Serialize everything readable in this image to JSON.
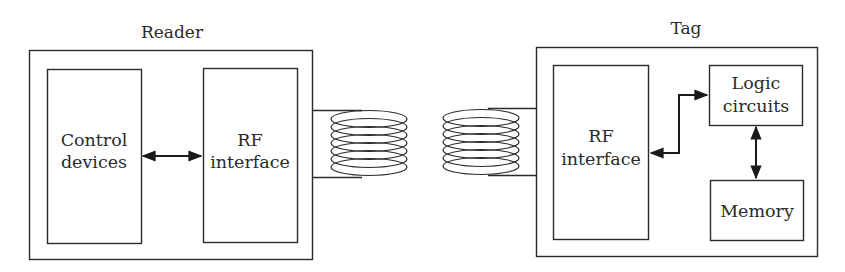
{
  "diagram": {
    "type": "block-diagram",
    "reader": {
      "title": "Reader",
      "blocks": {
        "control": [
          "Control",
          "devices"
        ],
        "rf": [
          "RF",
          "interface"
        ]
      }
    },
    "tag": {
      "title": "Tag",
      "blocks": {
        "rf": [
          "RF",
          "interface"
        ],
        "logic": [
          "Logic",
          "circuits"
        ],
        "memory": [
          "Memory"
        ]
      }
    },
    "connections": [
      {
        "from": "Control devices",
        "to": "RF interface (Reader)",
        "type": "bidirectional"
      },
      {
        "from": "RF interface (Reader)",
        "to": "Reader antenna coil",
        "type": "wire"
      },
      {
        "from": "Reader antenna coil",
        "to": "Tag antenna coil",
        "type": "inductive coupling"
      },
      {
        "from": "Tag antenna coil",
        "to": "RF interface (Tag)",
        "type": "wire"
      },
      {
        "from": "RF interface (Tag)",
        "to": "Logic circuits",
        "type": "bidirectional"
      },
      {
        "from": "Logic circuits",
        "to": "Memory",
        "type": "bidirectional"
      }
    ],
    "colors": {
      "stroke": "#2b2b2b",
      "text": "#2a2a2a",
      "background": "#ffffff"
    }
  }
}
